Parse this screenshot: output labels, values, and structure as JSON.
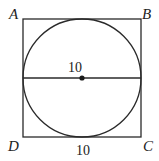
{
  "diagram": {
    "vertices": {
      "A": "A",
      "B": "B",
      "C": "C",
      "D": "D"
    },
    "labels": {
      "diameter_length": "10",
      "side_length": "10"
    },
    "colors": {
      "stroke": "#2a2a2a",
      "background": "#ffffff"
    }
  }
}
